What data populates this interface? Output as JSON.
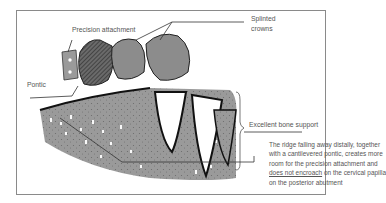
{
  "labels": {
    "precision_attachment": "Precision attachment",
    "splinted_crowns_line1": "Splinted",
    "splinted_crowns_line2": "crowns",
    "pontic": "Pontic",
    "bone_support": "Excellent bone support"
  },
  "description": {
    "line1": "The ridge falling away distally, together",
    "line2": "with a cantilevered pontic, creates more",
    "line3": "room for the precision attachment and",
    "line4_underlined": "does not encroach",
    "line4_rest": " on the cervical papilla",
    "line5": "on the posterior abutment"
  },
  "colors": {
    "frame": "#8a8a8a",
    "text": "#555555",
    "crown_fill": "#8c8c8c",
    "pontic_fill": "#5a5a5a",
    "bone_fill": "#8f8f8f",
    "line": "#333333"
  }
}
